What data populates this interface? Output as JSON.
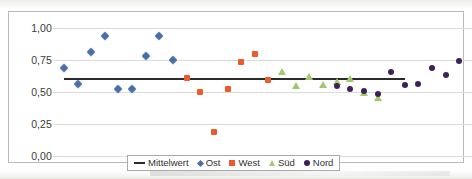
{
  "chart_data": {
    "type": "scatter",
    "title": "",
    "xlabel": "",
    "ylabel": "",
    "ylim": [
      0.0,
      1.0
    ],
    "yticks": [
      "0,00",
      "0,25",
      "0,50",
      "0,75",
      "1,00"
    ],
    "ytick_values": [
      0.0,
      0.25,
      0.5,
      0.75,
      1.0
    ],
    "grid": true,
    "legend_position": "bottom-center",
    "decimal_separator": ",",
    "series": [
      {
        "name": "Mittelwert",
        "marker": "line",
        "color": "#2b2b2b",
        "type": "mean-line",
        "value": 0.61,
        "x_start": 1,
        "x_end": 26
      },
      {
        "name": "Ost",
        "marker": "diamond",
        "color": "#4a6fa5",
        "points": [
          {
            "x": 1,
            "y": 0.685
          },
          {
            "x": 2,
            "y": 0.565
          },
          {
            "x": 3,
            "y": 0.81
          },
          {
            "x": 4,
            "y": 0.935
          },
          {
            "x": 5,
            "y": 0.525
          },
          {
            "x": 6,
            "y": 0.525
          },
          {
            "x": 7,
            "y": 0.78
          },
          {
            "x": 8,
            "y": 0.935
          },
          {
            "x": 9,
            "y": 0.75
          }
        ]
      },
      {
        "name": "West",
        "marker": "square",
        "color": "#ee5b2b",
        "points": [
          {
            "x": 10,
            "y": 0.61
          },
          {
            "x": 11,
            "y": 0.5
          },
          {
            "x": 12,
            "y": 0.19
          },
          {
            "x": 13,
            "y": 0.52
          },
          {
            "x": 14,
            "y": 0.735
          },
          {
            "x": 15,
            "y": 0.8
          },
          {
            "x": 16,
            "y": 0.59
          }
        ]
      },
      {
        "name": "Süd",
        "marker": "triangle",
        "color": "#a3c96a",
        "points": [
          {
            "x": 17,
            "y": 0.655
          },
          {
            "x": 18,
            "y": 0.545
          },
          {
            "x": 19,
            "y": 0.62
          },
          {
            "x": 20,
            "y": 0.555
          },
          {
            "x": 21,
            "y": 0.575
          },
          {
            "x": 22,
            "y": 0.605
          },
          {
            "x": 23,
            "y": 0.49
          },
          {
            "x": 24,
            "y": 0.455
          }
        ]
      },
      {
        "name": "Nord",
        "marker": "circle",
        "color": "#3e2159",
        "points": [
          {
            "x": 21,
            "y": 0.545
          },
          {
            "x": 22,
            "y": 0.525
          },
          {
            "x": 23,
            "y": 0.505
          },
          {
            "x": 24,
            "y": 0.485
          },
          {
            "x": 25,
            "y": 0.655
          },
          {
            "x": 26,
            "y": 0.555
          },
          {
            "x": 27,
            "y": 0.565
          },
          {
            "x": 28,
            "y": 0.685
          },
          {
            "x": 29,
            "y": 0.63
          },
          {
            "x": 30,
            "y": 0.74
          }
        ]
      }
    ]
  },
  "legend": {
    "items": [
      {
        "label": "Mittelwert",
        "marker": "line",
        "color": "#2b2b2b"
      },
      {
        "label": "Ost",
        "marker": "diamond",
        "color": "#4a6fa5"
      },
      {
        "label": "West",
        "marker": "square",
        "color": "#ee5b2b"
      },
      {
        "label": "Süd",
        "marker": "triangle",
        "color": "#a3c96a"
      },
      {
        "label": "Nord",
        "marker": "circle",
        "color": "#3e2159"
      }
    ]
  },
  "axis": {
    "y_labels": [
      "1,00",
      "0,75",
      "0,50",
      "0,25",
      "0,00"
    ]
  }
}
